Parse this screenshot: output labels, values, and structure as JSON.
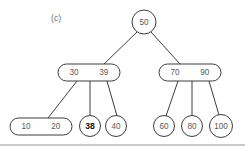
{
  "figure": {
    "panel_label": "(c)",
    "type": "2-3 tree / B-tree diagram",
    "colors": {
      "stroke": "#3d3d3d",
      "text": "#5a5a5a",
      "highlight_text": "#111111",
      "background": "#ffffff",
      "rule": "#c9c9c9"
    }
  },
  "tree": {
    "nodes": [
      {
        "id": "root",
        "shape": "circle",
        "keys": [
          "50"
        ],
        "cx": 144,
        "cy": 22,
        "r": 12,
        "highlight": false
      },
      {
        "id": "left-internal",
        "shape": "rounded-rect",
        "keys": [
          "30",
          "39"
        ],
        "x": 58,
        "y": 64,
        "w": 62,
        "h": 17,
        "highlight": false
      },
      {
        "id": "right-internal",
        "shape": "rounded-rect",
        "keys": [
          "70",
          "90"
        ],
        "x": 159,
        "y": 64,
        "w": 62,
        "h": 17,
        "highlight": false
      },
      {
        "id": "leaf-10-20",
        "shape": "rounded-rect",
        "keys": [
          "10",
          "20"
        ],
        "x": 10,
        "y": 118,
        "w": 62,
        "h": 17,
        "highlight": false
      },
      {
        "id": "leaf-38",
        "shape": "circle",
        "keys": [
          "38"
        ],
        "cx": 90,
        "cy": 126,
        "r": 10.5,
        "highlight": true
      },
      {
        "id": "leaf-40",
        "shape": "circle",
        "keys": [
          "40"
        ],
        "cx": 116,
        "cy": 126,
        "r": 10.5,
        "highlight": false
      },
      {
        "id": "leaf-60",
        "shape": "circle",
        "keys": [
          "60"
        ],
        "cx": 164,
        "cy": 126,
        "r": 10.5,
        "highlight": false
      },
      {
        "id": "leaf-80",
        "shape": "circle",
        "keys": [
          "80"
        ],
        "cx": 192,
        "cy": 126,
        "r": 10.5,
        "highlight": false
      },
      {
        "id": "leaf-100",
        "shape": "circle",
        "keys": [
          "100"
        ],
        "cx": 221,
        "cy": 126,
        "r": 11.5,
        "highlight": false
      }
    ],
    "edges": [
      {
        "from": "root",
        "to": "left-internal",
        "x1": 137,
        "y1": 32,
        "x2": 104,
        "y2": 64
      },
      {
        "from": "root",
        "to": "right-internal",
        "x1": 151,
        "y1": 32,
        "x2": 180,
        "y2": 64
      },
      {
        "from": "left-internal",
        "to": "leaf-10-20",
        "x1": 77,
        "y1": 81,
        "x2": 48,
        "y2": 118
      },
      {
        "from": "left-internal",
        "to": "leaf-38",
        "x1": 90,
        "y1": 81,
        "x2": 90,
        "y2": 115
      },
      {
        "from": "left-internal",
        "to": "leaf-40",
        "x1": 107,
        "y1": 81,
        "x2": 117,
        "y2": 116
      },
      {
        "from": "right-internal",
        "to": "leaf-60",
        "x1": 178,
        "y1": 81,
        "x2": 166,
        "y2": 116
      },
      {
        "from": "right-internal",
        "to": "leaf-80",
        "x1": 192,
        "y1": 81,
        "x2": 192,
        "y2": 115
      },
      {
        "from": "right-internal",
        "to": "leaf-100",
        "x1": 209,
        "y1": 81,
        "x2": 219,
        "y2": 115
      }
    ]
  }
}
